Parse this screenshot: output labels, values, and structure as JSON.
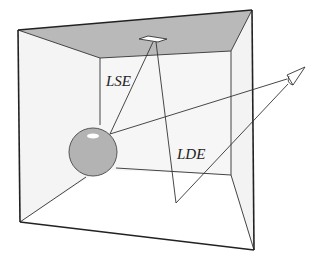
{
  "diagram": {
    "type": "light-path-scene",
    "labels": {
      "lse": "LSE",
      "lde": "LDE"
    },
    "colors": {
      "ceiling": "#b9b9b9",
      "walls": "#f4f4f4",
      "floor": "#ffffff",
      "sphere": "#b3b3b3",
      "lines": "#333333"
    },
    "elements": [
      "room",
      "ceiling-light",
      "specular-sphere",
      "eye",
      "path-LSE",
      "path-LDE"
    ]
  }
}
